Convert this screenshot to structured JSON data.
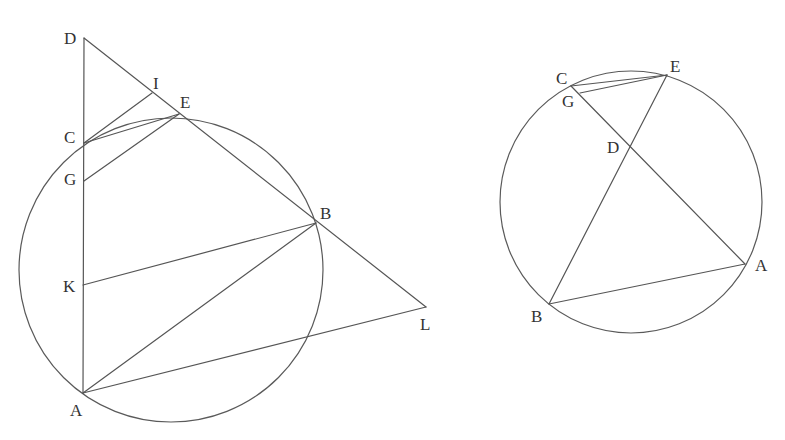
{
  "figures": [
    {
      "id": "left",
      "circle": {
        "cx": 171,
        "cy": 270,
        "r": 152
      },
      "points": {
        "D": {
          "x": 84,
          "y": 38
        },
        "I": {
          "x": 152,
          "y": 93
        },
        "E": {
          "x": 179,
          "y": 114
        },
        "C": {
          "x": 84,
          "y": 143
        },
        "G": {
          "x": 84,
          "y": 181
        },
        "K": {
          "x": 83,
          "y": 285
        },
        "B": {
          "x": 316,
          "y": 223
        },
        "L": {
          "x": 426,
          "y": 307
        },
        "A": {
          "x": 83,
          "y": 393
        }
      },
      "labels": [
        {
          "text": "D",
          "x": 64,
          "y": 44
        },
        {
          "text": "I",
          "x": 153,
          "y": 89
        },
        {
          "text": "E",
          "x": 180,
          "y": 108
        },
        {
          "text": "C",
          "x": 64,
          "y": 143
        },
        {
          "text": "G",
          "x": 64,
          "y": 185
        },
        {
          "text": "K",
          "x": 63,
          "y": 292
        },
        {
          "text": "B",
          "x": 320,
          "y": 219
        },
        {
          "text": "L",
          "x": 420,
          "y": 330
        },
        {
          "text": "A",
          "x": 70,
          "y": 416
        }
      ],
      "segments": [
        [
          "D",
          "A"
        ],
        [
          "D",
          "L"
        ],
        [
          "C",
          "I"
        ],
        [
          "C",
          "E"
        ],
        [
          "G",
          "E"
        ],
        [
          "K",
          "B"
        ],
        [
          "A",
          "B"
        ],
        [
          "A",
          "L"
        ]
      ],
      "arcs": [
        {
          "from": "C",
          "to": "E",
          "note": "circle arc between C and E (part of circle)"
        }
      ]
    },
    {
      "id": "right",
      "circle": {
        "cx": 631,
        "cy": 202,
        "r": 131
      },
      "points": {
        "C": {
          "x": 571,
          "y": 86
        },
        "E": {
          "x": 667,
          "y": 75
        },
        "G": {
          "x": 580,
          "y": 93
        },
        "D": {
          "x": 631,
          "y": 146
        },
        "A": {
          "x": 745,
          "y": 264
        },
        "B": {
          "x": 549,
          "y": 304
        }
      },
      "labels": [
        {
          "text": "C",
          "x": 556,
          "y": 84
        },
        {
          "text": "E",
          "x": 670,
          "y": 72
        },
        {
          "text": "G",
          "x": 562,
          "y": 107
        },
        {
          "text": "D",
          "x": 607,
          "y": 153
        },
        {
          "text": "A",
          "x": 755,
          "y": 271
        },
        {
          "text": "B",
          "x": 531,
          "y": 322
        }
      ],
      "segments": [
        [
          "C",
          "E"
        ],
        [
          "G",
          "E"
        ],
        [
          "C",
          "A"
        ],
        [
          "E",
          "B"
        ],
        [
          "B",
          "A"
        ]
      ]
    }
  ],
  "colors": {
    "stroke": "#555555",
    "label": "#333333",
    "background": "#ffffff"
  }
}
